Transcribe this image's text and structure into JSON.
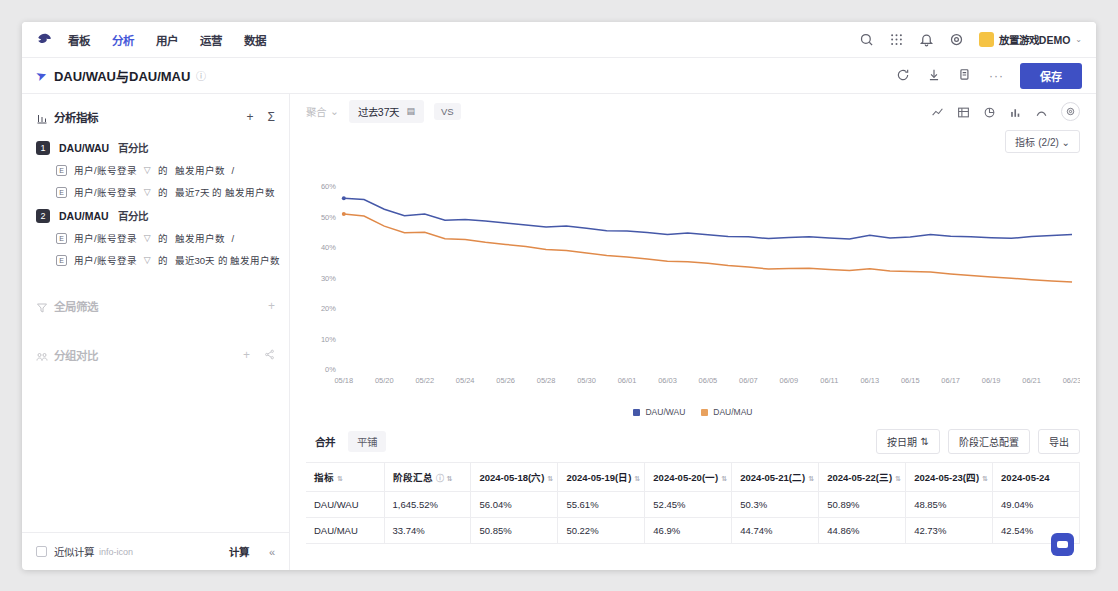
{
  "nav": {
    "logo_icon": "bird-logo-icon",
    "items": [
      {
        "label": "看板",
        "active": false
      },
      {
        "label": "分析",
        "active": true
      },
      {
        "label": "用户",
        "active": false
      },
      {
        "label": "运营",
        "active": false
      },
      {
        "label": "数据",
        "active": false
      }
    ],
    "icons": [
      "search-icon",
      "apps-grid-icon",
      "bell-icon",
      "settings-icon"
    ],
    "account": "放置游戏DEMO",
    "account_caret": "⌄"
  },
  "titlebar": {
    "pin_icon": "pin-icon",
    "title": "DAU/WAU与DAU/MAU",
    "info_icon": "info-icon",
    "icons": [
      "refresh-icon",
      "download-icon",
      "copy-icon"
    ],
    "more": "···",
    "save_label": "保存"
  },
  "left_panel": {
    "metrics_section": {
      "icon": "metrics-icon",
      "title": "分析指标",
      "add": "+",
      "sigma": "Σ",
      "metrics": [
        {
          "num": "1",
          "name": "DAU/WAU",
          "type": "百分比",
          "rows": [
            {
              "event_icon": "event-icon",
              "event": "用户/账号登录",
              "filter_icon": "funnel-icon",
              "de": "的",
              "measure": "触发用户数",
              "op": "/"
            },
            {
              "event_icon": "event-icon",
              "event": "用户/账号登录",
              "filter_icon": "funnel-icon",
              "de": "的",
              "measure": "最近7天 的 触发用户数",
              "op": ""
            }
          ]
        },
        {
          "num": "2",
          "name": "DAU/MAU",
          "type": "百分比",
          "rows": [
            {
              "event_icon": "event-icon",
              "event": "用户/账号登录",
              "filter_icon": "funnel-icon",
              "de": "的",
              "measure": "触发用户数",
              "op": "/"
            },
            {
              "event_icon": "event-icon",
              "event": "用户/账号登录",
              "filter_icon": "funnel-icon",
              "de": "的",
              "measure": "最近30天 的 触发用户数",
              "op": ""
            }
          ]
        }
      ]
    },
    "global_filter": {
      "icon": "filter-icon",
      "title": "全局筛选",
      "add": "+"
    },
    "group_compare": {
      "icon": "group-icon",
      "title": "分组对比",
      "add": "+",
      "share": "share-icon"
    },
    "footer": {
      "checkbox_label": "近似计算",
      "info_icon": "info-icon",
      "calc_label": "计算",
      "collapse_icon": "«"
    }
  },
  "chart_toolbar": {
    "faded_select": "聚合",
    "date_range": "过去37天",
    "calendar_icon": "calendar-icon",
    "vs_label": "VS",
    "view_icons": [
      "line-chart-icon",
      "table-icon",
      "pie-chart-icon",
      "bar-chart-icon",
      "trend-icon"
    ],
    "gear_icon": "gear-icon",
    "metric_selector": "指标 (2/2)",
    "metric_selector_caret": "⌄"
  },
  "chart_data": {
    "type": "line",
    "title": "",
    "xlabel": "",
    "ylabel": "",
    "ylim": [
      0,
      65
    ],
    "yticks": [
      "0%",
      "10%",
      "20%",
      "30%",
      "40%",
      "50%",
      "60%"
    ],
    "ytick_values": [
      0,
      10,
      20,
      30,
      40,
      50,
      60
    ],
    "grid": false,
    "legend_position": "bottom",
    "x": [
      "05/18",
      "05/19",
      "05/20",
      "05/21",
      "05/22",
      "05/23",
      "05/24",
      "05/25",
      "05/26",
      "05/27",
      "05/28",
      "05/29",
      "05/30",
      "05/31",
      "06/01",
      "06/02",
      "06/03",
      "06/04",
      "06/05",
      "06/06",
      "06/07",
      "06/08",
      "06/09",
      "06/10",
      "06/11",
      "06/12",
      "06/13",
      "06/14",
      "06/15",
      "06/16",
      "06/17",
      "06/18",
      "06/19",
      "06/20",
      "06/21",
      "06/22",
      "06/23"
    ],
    "xticks": [
      "05/18",
      "05/20",
      "05/22",
      "05/24",
      "05/26",
      "05/28",
      "05/30",
      "06/01",
      "06/03",
      "06/05",
      "06/07",
      "06/09",
      "06/11",
      "06/13",
      "06/15",
      "06/17",
      "06/19",
      "06/21",
      "06/23"
    ],
    "series": [
      {
        "name": "DAU/WAU",
        "color": "#4558a8",
        "values": [
          56.04,
          55.61,
          52.45,
          50.3,
          50.89,
          48.85,
          49.04,
          48.6,
          47.9,
          47.3,
          46.6,
          46.9,
          46.2,
          45.4,
          45.3,
          44.8,
          44.2,
          44.6,
          44.1,
          43.5,
          43.4,
          42.8,
          43.2,
          43.4,
          43.0,
          42.7,
          43.9,
          43.0,
          43.3,
          44.2,
          43.6,
          43.4,
          43.1,
          42.9,
          43.5,
          43.8,
          44.2
        ]
      },
      {
        "name": "DAU/MAU",
        "color": "#e08a4a",
        "values": [
          50.85,
          50.22,
          46.9,
          44.74,
          44.86,
          42.73,
          42.54,
          41.6,
          40.9,
          40.2,
          39.2,
          38.9,
          38.1,
          37.3,
          36.8,
          36.1,
          35.4,
          35.2,
          34.7,
          34.0,
          33.5,
          32.8,
          33.0,
          33.1,
          32.7,
          32.3,
          32.9,
          32.2,
          32.0,
          31.8,
          31.2,
          30.7,
          30.2,
          29.8,
          29.3,
          28.9,
          28.6
        ]
      }
    ],
    "legend": [
      {
        "label": "DAU/WAU",
        "color": "#4558a8"
      },
      {
        "label": "DAU/MAU",
        "color": "#e8a15e"
      }
    ]
  },
  "table_panel": {
    "tabs": [
      {
        "label": "合并",
        "active": true
      },
      {
        "label": "平铺",
        "active": false
      }
    ],
    "actions": [
      {
        "label": "按日期",
        "icon": "sort-icon"
      },
      {
        "label": "阶段汇总配置",
        "icon": ""
      },
      {
        "label": "导出",
        "icon": ""
      }
    ],
    "columns": [
      {
        "label": "指标",
        "sort": "⇅"
      },
      {
        "label": "阶段汇总",
        "info": "ⓘ",
        "sort": "⇅"
      },
      {
        "label": "2024-05-18(六)",
        "sort": "⇅"
      },
      {
        "label": "2024-05-19(日)",
        "sort": "⇅"
      },
      {
        "label": "2024-05-20(一)",
        "sort": "⇅"
      },
      {
        "label": "2024-05-21(二)",
        "sort": "⇅"
      },
      {
        "label": "2024-05-22(三)",
        "sort": "⇅"
      },
      {
        "label": "2024-05-23(四)",
        "sort": "⇅"
      },
      {
        "label": "2024-05-24",
        "sort": ""
      }
    ],
    "rows": [
      {
        "cells": [
          "DAU/WAU",
          "1,645.52%",
          "56.04%",
          "55.61%",
          "52.45%",
          "50.3%",
          "50.89%",
          "48.85%",
          "49.04%"
        ]
      },
      {
        "cells": [
          "DAU/MAU",
          "33.74%",
          "50.85%",
          "50.22%",
          "46.9%",
          "44.74%",
          "44.86%",
          "42.73%",
          "42.54%"
        ]
      }
    ]
  },
  "fab": {
    "icon": "assistant-icon"
  }
}
